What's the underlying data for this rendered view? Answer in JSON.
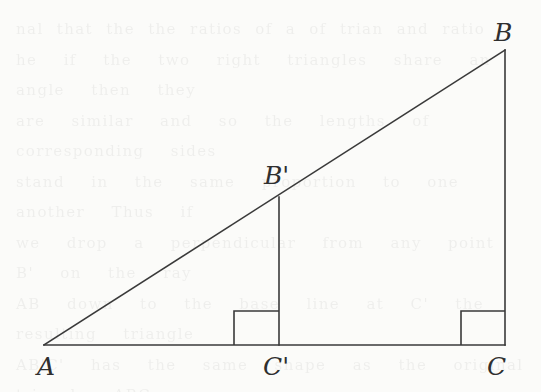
{
  "figure": {
    "kind": "geometry-diagram",
    "background_color": "#fbfbf9",
    "stroke_color": "#3a3a3a",
    "stroke_width": 1.6,
    "width": 541,
    "height": 392
  },
  "points": [
    {
      "id": "A",
      "label": "A",
      "x": 44,
      "y": 345
    },
    {
      "id": "B",
      "label": "B",
      "x": 505,
      "y": 50
    },
    {
      "id": "C",
      "label": "C",
      "x": 505,
      "y": 345
    },
    {
      "id": "Bp",
      "label": "B'",
      "x": 279,
      "y": 197
    },
    {
      "id": "Cp",
      "label": "C'",
      "x": 279,
      "y": 345
    }
  ],
  "labels": [
    {
      "id": "label-A",
      "text": "A",
      "base": "A",
      "prime": "",
      "left": 37,
      "top": 354
    },
    {
      "id": "label-B",
      "text": "B",
      "base": "B",
      "prime": "",
      "left": 494,
      "top": 20
    },
    {
      "id": "label-C",
      "text": "C",
      "base": "C",
      "prime": "",
      "left": 487,
      "top": 354
    },
    {
      "id": "label-Bp",
      "text": "B'",
      "base": "B",
      "prime": "'",
      "left": 264,
      "top": 163
    },
    {
      "id": "label-Cp",
      "text": "C'",
      "base": "C",
      "prime": "'",
      "left": 263,
      "top": 354
    }
  ],
  "segments": [
    {
      "id": "hypotenuse-AB",
      "name": "hypotenuse-a-to-b",
      "x1": 44,
      "y1": 345,
      "x2": 505,
      "y2": 50
    },
    {
      "id": "base-AC",
      "name": "base-a-to-c",
      "x1": 44,
      "y1": 345,
      "x2": 505,
      "y2": 345
    },
    {
      "id": "leg-BC",
      "name": "leg-b-to-c",
      "x1": 505,
      "y1": 50,
      "x2": 505,
      "y2": 345
    },
    {
      "id": "leg-BpCp",
      "name": "leg-bprime-to-cprime",
      "x1": 279,
      "y1": 197,
      "x2": 279,
      "y2": 345
    }
  ],
  "right_angle_marks": [
    {
      "id": "right-angle-Cp",
      "at": "C'",
      "x": 234,
      "y": 311,
      "w": 45,
      "h": 34
    },
    {
      "id": "right-angle-C",
      "at": "C",
      "x": 461,
      "y": 311,
      "w": 44,
      "h": 34
    }
  ],
  "scan_noise_text": "nal that the the ratios of a of trian and ratio\nhe  if  the  two  right  triangles  share  an  angle  then  they\nare  similar  and  so  the  lengths  of  corresponding  sides\nstand  in  the  same  proportion  to  one  another  Thus  if\nwe  drop  a  perpendicular  from  any  point  B'  on  the  ray\nAB  down  to  the  base  line  at  C'  the  resulting  triangle\nAB'C'  has  the  same  shape  as  the  original  triangle  ABC\nand  hence  the  quotient  B'C'  over  AC'  equals  BC  over\nAC  which  is  exactly  the  tangent  of  the  angle  at  A  and\nso  depends  only  on  the  angle  and  not  on  the  choice  of\nthe  point  B'  along  the  ray  as  was  to  be  shown"
}
